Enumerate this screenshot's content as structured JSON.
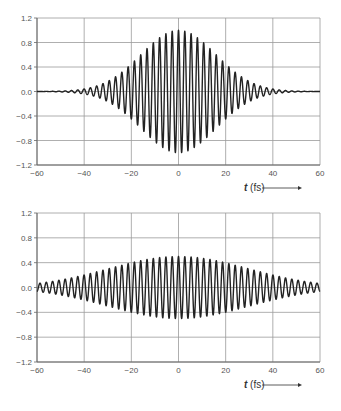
{
  "chart_data": [
    {
      "type": "line",
      "title": "",
      "xlabel_var": "t",
      "xlabel_unit": " (fs)",
      "ylabel": "",
      "xlim": [
        -60,
        60
      ],
      "ylim": [
        -1.2,
        1.2
      ],
      "xticks": [
        -60,
        -40,
        -20,
        0,
        20,
        40,
        60
      ],
      "xtick_labels": [
        "−60",
        "−40",
        "−20",
        "0",
        "20",
        "40",
        "60"
      ],
      "yticks": [
        1.2,
        0.8,
        0.4,
        0.0,
        -0.4,
        -0.8,
        -1.2
      ],
      "ytick_labels": [
        "1.2",
        "0.8",
        "0.4",
        "0.0",
        "−0.4",
        "−0.8",
        "−1.2"
      ],
      "grid": true,
      "series": [
        {
          "name": "short pulse",
          "model": "A*exp(-(t/tau)^2)*cos(2*pi*t/T)",
          "amplitude": 1.0,
          "tau_fs": 22.4,
          "period_fs": 2.67,
          "color": "#222222"
        }
      ],
      "box": {
        "left": 37,
        "top": 18,
        "right": 320,
        "bottom": 165
      }
    },
    {
      "type": "line",
      "title": "",
      "xlabel_var": "t",
      "xlabel_unit": " (fs)",
      "ylabel": "",
      "xlim": [
        -60,
        60
      ],
      "ylim": [
        -1.2,
        1.2
      ],
      "xticks": [
        -60,
        -40,
        -20,
        0,
        20,
        40,
        60
      ],
      "xtick_labels": [
        "−60",
        "−40",
        "−20",
        "0",
        "20",
        "40",
        "60"
      ],
      "yticks": [
        1.2,
        0.8,
        0.4,
        0.0,
        -0.4,
        -0.8,
        -1.2
      ],
      "ytick_labels": [
        "1.2",
        "0.8",
        "0.4",
        "0.0",
        "−0.4",
        "−0.8",
        "−1.2"
      ],
      "grid": true,
      "series": [
        {
          "name": "long pulse",
          "model": "A*exp(-(t/tau)^2)*cos(2*pi*t/T)",
          "amplitude": 0.5,
          "tau_fs": 42,
          "period_fs": 2.67,
          "color": "#222222"
        }
      ],
      "box": {
        "left": 37,
        "top": 213,
        "right": 320,
        "bottom": 362
      }
    }
  ],
  "styles": {
    "grid_color": "#9a9a9a",
    "axis_color": "#666666",
    "tick_text_color": "#555555"
  }
}
